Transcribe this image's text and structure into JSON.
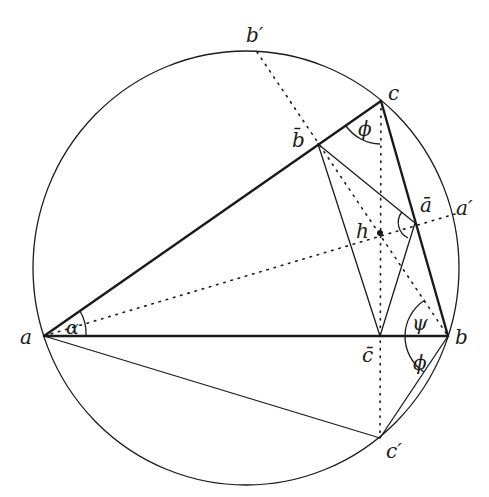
{
  "diagram": {
    "type": "geometry",
    "circle": {
      "cx": 246,
      "cy": 268,
      "r": 215
    },
    "points": {
      "a": {
        "label": "a",
        "x": 44,
        "y": 336
      },
      "b": {
        "label": "b",
        "x": 448,
        "y": 336
      },
      "c": {
        "label": "c",
        "x": 381,
        "y": 101
      },
      "a_bar": {
        "label": "ā",
        "x": 415,
        "y": 223
      },
      "b_bar": {
        "label": "b̄",
        "x": 318,
        "y": 144
      },
      "c_bar": {
        "label": "c̄",
        "x": 380,
        "y": 336
      },
      "h": {
        "label": "h",
        "x": 380,
        "y": 233
      },
      "a_prime": {
        "label": "a′",
        "x": 455,
        "y": 214
      },
      "b_prime": {
        "label": "b′",
        "x": 257,
        "y": 52
      },
      "c_prime": {
        "label": "c′",
        "x": 380,
        "y": 438
      }
    },
    "angles": {
      "alpha": {
        "label": "α",
        "vertex": "a"
      },
      "phi_c": {
        "label": "ϕ",
        "vertex": "c"
      },
      "psi_b": {
        "label": "ψ",
        "vertex": "b"
      },
      "phi_b": {
        "label": "ϕ",
        "vertex": "b"
      }
    }
  }
}
